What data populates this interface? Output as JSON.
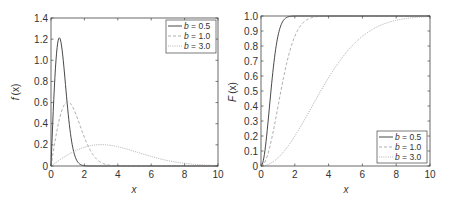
{
  "chart_data": [
    {
      "type": "line",
      "title": "",
      "xlabel": "x",
      "ylabel": "f (x)",
      "xlim": [
        0,
        10
      ],
      "ylim": [
        0,
        1.4
      ],
      "xticks": [
        0,
        2,
        4,
        6,
        8,
        10
      ],
      "xtick_labels": [
        "0",
        "2",
        "4",
        "6",
        "8",
        "10"
      ],
      "yticks": [
        0,
        0.2,
        0.4,
        0.6,
        0.8,
        1.0,
        1.2,
        1.4
      ],
      "ytick_labels": [
        "0",
        "0.2",
        "0.4",
        "0.6",
        "0.8",
        "1.0",
        "1.2",
        "1.4"
      ],
      "grid": false,
      "legend_position": "upper right",
      "series": [
        {
          "name": "b = 0.5",
          "b": 0.5,
          "style": "solid",
          "color": "#333333",
          "x": [
            0,
            0.25,
            0.5,
            0.75,
            1.0,
            1.25,
            1.5,
            1.75,
            2.0,
            2.5,
            10
          ],
          "y": [
            0,
            0.88,
            1.21,
            0.98,
            0.54,
            0.22,
            0.07,
            0.02,
            0.0,
            0.0,
            0.0
          ]
        },
        {
          "name": "b = 1.0",
          "b": 1.0,
          "style": "dashed",
          "color": "#999999",
          "x": [
            0,
            0.5,
            1.0,
            1.5,
            2.0,
            2.5,
            3.0,
            3.5,
            4.0,
            10
          ],
          "y": [
            0,
            0.44,
            0.61,
            0.49,
            0.27,
            0.11,
            0.03,
            0.01,
            0.0,
            0.0
          ]
        },
        {
          "name": "b = 3.0",
          "b": 3.0,
          "style": "dotted",
          "color": "#aaaaaa",
          "x": [
            0,
            1,
            2,
            3,
            4,
            5,
            6,
            7,
            8,
            9,
            10
          ],
          "y": [
            0,
            0.11,
            0.18,
            0.2,
            0.18,
            0.14,
            0.09,
            0.05,
            0.03,
            0.01,
            0.005
          ]
        }
      ]
    },
    {
      "type": "line",
      "title": "",
      "xlabel": "x",
      "ylabel": "F (x)",
      "xlim": [
        0,
        10
      ],
      "ylim": [
        0,
        1.0
      ],
      "xticks": [
        0,
        2,
        4,
        6,
        8,
        10
      ],
      "xtick_labels": [
        "0",
        "2",
        "4",
        "6",
        "8",
        "10"
      ],
      "yticks": [
        0,
        0.1,
        0.2,
        0.3,
        0.4,
        0.5,
        0.6,
        0.7,
        0.8,
        0.9,
        1.0
      ],
      "ytick_labels": [
        "0",
        "0.1",
        "0.2",
        "0.3",
        "0.4",
        "0.5",
        "0.6",
        "0.7",
        "0.8",
        "0.9",
        "1.0"
      ],
      "grid": false,
      "legend_position": "lower right",
      "series": [
        {
          "name": "b = 0.5",
          "b": 0.5,
          "style": "solid",
          "color": "#333333",
          "x": [
            0,
            0.25,
            0.5,
            0.75,
            1.0,
            1.25,
            1.5,
            2.0,
            10
          ],
          "y": [
            0,
            0.12,
            0.39,
            0.68,
            0.86,
            0.96,
            0.99,
            1.0,
            1.0
          ]
        },
        {
          "name": "b = 1.0",
          "b": 1.0,
          "style": "dashed",
          "color": "#999999",
          "x": [
            0,
            0.5,
            1.0,
            1.5,
            2.0,
            2.5,
            3.0,
            3.5,
            10
          ],
          "y": [
            0,
            0.12,
            0.39,
            0.68,
            0.86,
            0.96,
            0.99,
            1.0,
            1.0
          ]
        },
        {
          "name": "b = 3.0",
          "b": 3.0,
          "style": "dotted",
          "color": "#aaaaaa",
          "x": [
            0,
            1,
            2,
            3,
            4,
            5,
            6,
            7,
            8,
            9,
            10
          ],
          "y": [
            0,
            0.05,
            0.2,
            0.39,
            0.59,
            0.75,
            0.86,
            0.93,
            0.97,
            0.99,
            1.0
          ]
        }
      ]
    }
  ],
  "left": {
    "ylabel_f": "f",
    "ylabel_x": "(x)",
    "xlabel": "x",
    "legend": [
      {
        "var": "b",
        "text": " = 0.5"
      },
      {
        "var": "b",
        "text": " = 1.0"
      },
      {
        "var": "b",
        "text": " = 3.0"
      }
    ]
  },
  "right": {
    "ylabel_f": "F",
    "ylabel_x": "(x)",
    "xlabel": "x",
    "legend": [
      {
        "var": "b",
        "text": " = 0.5"
      },
      {
        "var": "b",
        "text": " = 1.0"
      },
      {
        "var": "b",
        "text": " = 3.0"
      }
    ]
  }
}
